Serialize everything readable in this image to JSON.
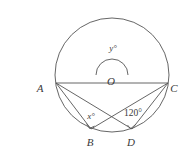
{
  "figure": {
    "kind": "circle-geometry-diagram",
    "background_color": "#ffffff",
    "stroke_color": "#4a4a4a",
    "label_color": "#3a3a3a",
    "circle": {
      "center_label": "O",
      "center_x": 112,
      "center_y": 75,
      "radius": 57
    },
    "points": [
      {
        "id": "A",
        "label": "A",
        "x": 56,
        "y": 83,
        "label_x": 40,
        "label_y": 92
      },
      {
        "id": "C",
        "label": "C",
        "x": 168,
        "y": 83,
        "label_x": 172,
        "label_y": 92
      },
      {
        "id": "O",
        "label": "O",
        "x": 112,
        "y": 75,
        "label_x": 108,
        "label_y": 84
      },
      {
        "id": "B",
        "label": "B",
        "x": 91,
        "y": 129,
        "label_x": 87,
        "label_y": 145
      },
      {
        "id": "D",
        "label": "D",
        "x": 132,
        "y": 129,
        "label_x": 128,
        "label_y": 145
      }
    ],
    "segments": [
      {
        "from": "A",
        "to": "C"
      },
      {
        "from": "A",
        "to": "B"
      },
      {
        "from": "A",
        "to": "D"
      },
      {
        "from": "C",
        "to": "B"
      },
      {
        "from": "C",
        "to": "D"
      }
    ],
    "angles": [
      {
        "id": "y",
        "label": "y°",
        "at": "O",
        "label_x": 112,
        "label_y": 47,
        "marker": "arc",
        "arc_radius": 16
      },
      {
        "id": "x",
        "label": "x°",
        "at": "B",
        "label_x": 90,
        "label_y": 117,
        "marker": "small-square"
      },
      {
        "id": "angle120",
        "label": "120°",
        "at": "D",
        "label_x": 132,
        "label_y": 114,
        "marker": "small-square"
      }
    ],
    "right_angle_markers": [
      {
        "at": "B",
        "x": 90,
        "y": 123
      },
      {
        "at": "D",
        "x": 131,
        "y": 123
      }
    ]
  }
}
